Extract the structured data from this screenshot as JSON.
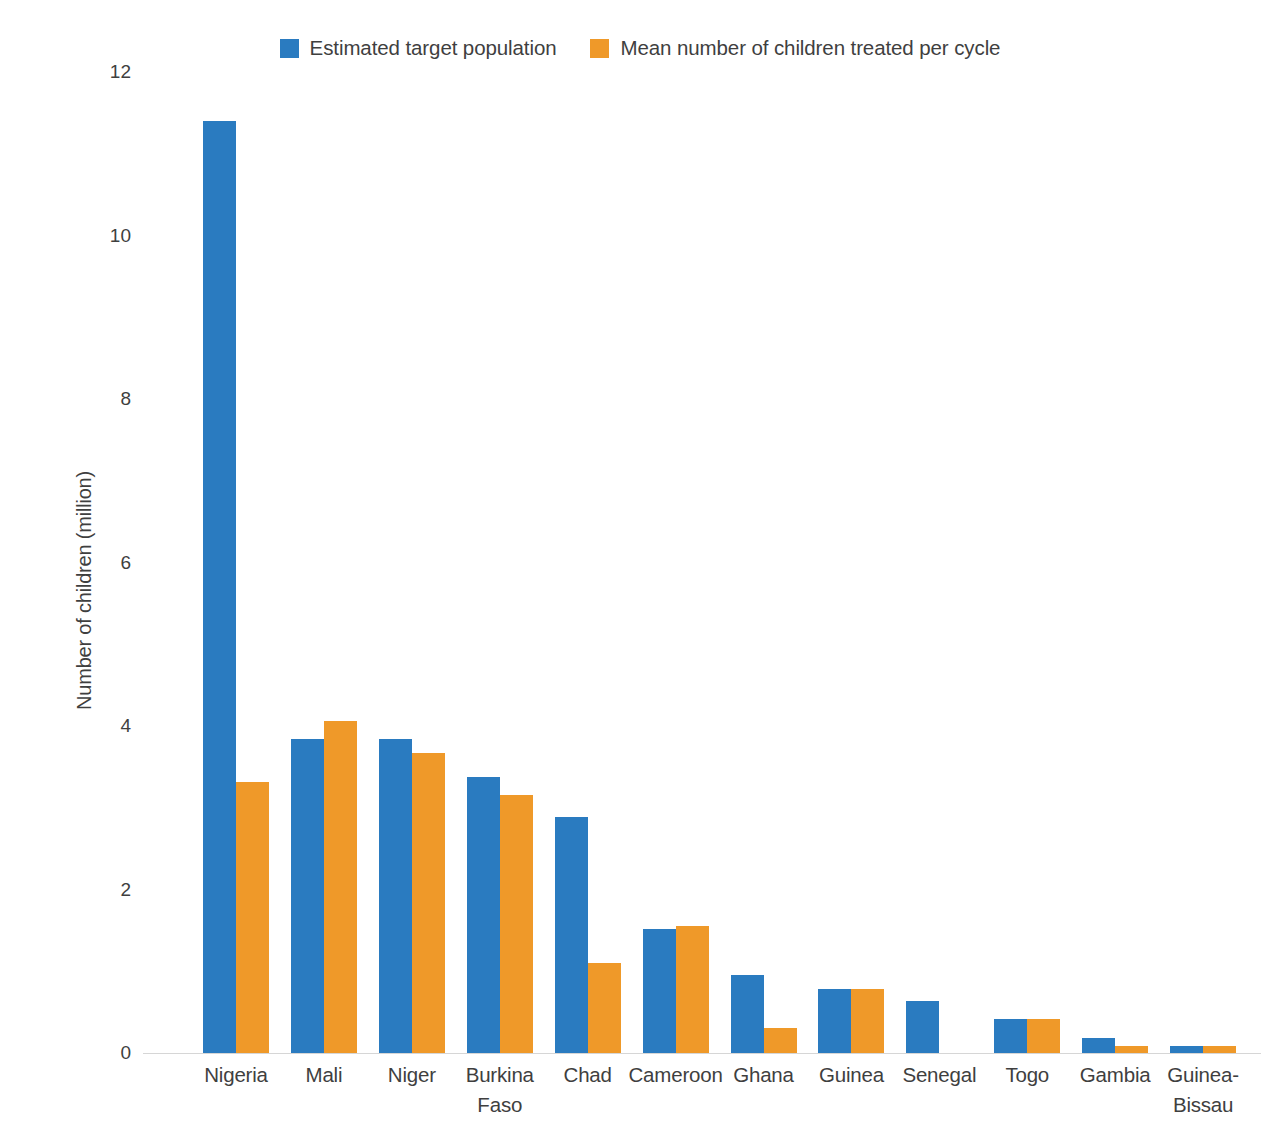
{
  "chart_data": {
    "type": "bar",
    "title": "",
    "subtitle": "",
    "xlabel": "",
    "ylabel": "Number of children (million)",
    "ylim": [
      0,
      12
    ],
    "ytick_labels": [
      "12",
      "10",
      "8",
      "6",
      "4",
      "2",
      "0"
    ],
    "ytick_values": [
      12,
      10,
      8,
      6,
      4,
      2,
      0
    ],
    "grid": false,
    "legend_position": "top-center",
    "categories": [
      "Nigeria",
      "Mali",
      "Niger",
      "Burkina\nFaso",
      "Chad",
      "Cameroon",
      "Ghana",
      "Guinea",
      "Senegal",
      "Togo",
      "Gambia",
      "Guinea-\nBissau"
    ],
    "series": [
      {
        "name": "Estimated target population",
        "color": "#2a7bc0",
        "values": [
          11.4,
          3.84,
          3.84,
          3.38,
          2.89,
          1.52,
          0.95,
          0.78,
          0.64,
          0.42,
          0.18,
          0.08
        ]
      },
      {
        "name": "Mean number of children treated per cycle",
        "color": "#ef9929",
        "values": [
          3.32,
          4.06,
          3.67,
          3.16,
          1.1,
          1.55,
          0.31,
          0.78,
          null,
          0.42,
          0.09,
          0.09
        ]
      }
    ]
  },
  "legend": {
    "items": [
      {
        "label": "Estimated target population",
        "color": "#2a7bc0",
        "swatch": "square-swatch-blue"
      },
      {
        "label": "Mean number of children treated per cycle",
        "color": "#ef9929",
        "swatch": "square-swatch-orange"
      }
    ]
  },
  "axes": {
    "y_title": "Number of children (million)"
  }
}
